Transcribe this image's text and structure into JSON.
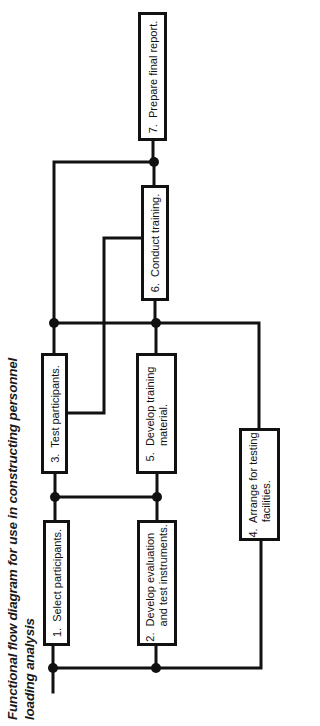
{
  "title": {
    "line1": "Functional flow diagram for use in constructing personnel",
    "line2": "loading analysis"
  },
  "colors": {
    "line": "#111111",
    "background": "#ffffff"
  },
  "nodes": [
    {
      "id": 1,
      "label": "1.  Select participants."
    },
    {
      "id": 2,
      "label": "2.  Develop evaluation\n     and test instruments."
    },
    {
      "id": 3,
      "label": "3.  Test participants."
    },
    {
      "id": 4,
      "label": "4.  Arrange for testing\n     facilities."
    },
    {
      "id": 5,
      "label": "5.  Develop training\n     material."
    },
    {
      "id": 6,
      "label": "6.  Conduct training."
    },
    {
      "id": 7,
      "label": "7.  Prepare final report."
    }
  ],
  "edges": [
    {
      "from": "start",
      "to": "junction-A"
    },
    {
      "from": "junction-A",
      "to": 1
    },
    {
      "from": "junction-A",
      "to": 2
    },
    {
      "from": "junction-A",
      "to": 4
    },
    {
      "from": 1,
      "to": "junction-B"
    },
    {
      "from": 2,
      "to": "junction-B"
    },
    {
      "from": "junction-B",
      "to": 3
    },
    {
      "from": "junction-B",
      "to": 5
    },
    {
      "from": 3,
      "to": "junction-C"
    },
    {
      "from": 5,
      "to": "junction-C"
    },
    {
      "from": 4,
      "to": "junction-C"
    },
    {
      "from": 3,
      "to": 6
    },
    {
      "from": "junction-C",
      "to": 6
    },
    {
      "from": 6,
      "to": "junction-D"
    },
    {
      "from": "junction-C",
      "to": "junction-D"
    },
    {
      "from": "junction-D",
      "to": 7
    }
  ]
}
